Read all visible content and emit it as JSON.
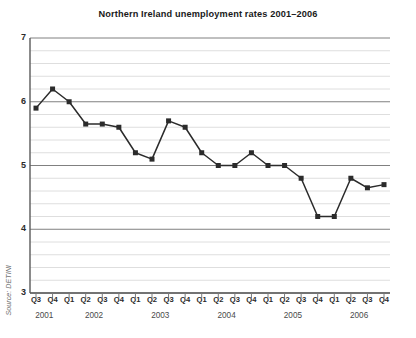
{
  "chart_data": {
    "type": "line",
    "title": "Northern Ireland unemployment rates 2001–2006",
    "source": "Source: DETINI",
    "xlabel": "",
    "ylabel": "",
    "ylim": [
      3,
      7
    ],
    "y_ticks": [
      7,
      6,
      5,
      4,
      3
    ],
    "y_minor_step": 0.2,
    "grid": true,
    "legend": "none",
    "marker": "square",
    "line_color": "#2b2b2b",
    "grid_major_color": "#808080",
    "grid_minor_color": "#d5d5d5",
    "categories": [
      "Q3",
      "Q4",
      "Q1",
      "Q2",
      "Q3",
      "Q4",
      "Q1",
      "Q2",
      "Q3",
      "Q4",
      "Q1",
      "Q2",
      "Q3",
      "Q4",
      "Q1",
      "Q2",
      "Q3",
      "Q4",
      "Q1",
      "Q2",
      "Q3",
      "Q4"
    ],
    "year_groups": [
      {
        "year": "2001",
        "start_index": 0,
        "count": 2
      },
      {
        "year": "2002",
        "start_index": 2,
        "count": 4
      },
      {
        "year": "2003",
        "start_index": 6,
        "count": 4
      },
      {
        "year": "2004",
        "start_index": 10,
        "count": 4
      },
      {
        "year": "2005",
        "start_index": 14,
        "count": 4
      },
      {
        "year": "2006",
        "start_index": 18,
        "count": 4
      }
    ],
    "values": [
      5.9,
      6.2,
      6.0,
      5.65,
      5.65,
      5.6,
      5.2,
      5.1,
      5.7,
      5.6,
      5.2,
      5.0,
      5.0,
      5.2,
      5.0,
      5.0,
      4.8,
      4.2,
      4.2,
      4.8,
      4.65,
      4.7
    ],
    "value_labels": [
      "5.9",
      "6.2",
      "6.0",
      "5.65",
      "5.65",
      "5.6",
      "5.2",
      "5.1",
      "5.7",
      "5.6",
      "5.2",
      "5.0",
      "5.0",
      "5.2",
      "5.0",
      "5.0",
      "4.8",
      "4.2",
      "4.2",
      "4.8",
      "4.65",
      "4.7"
    ]
  }
}
